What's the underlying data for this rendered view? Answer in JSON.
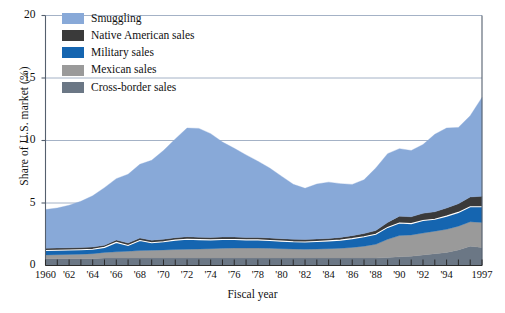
{
  "chart_data": {
    "type": "area",
    "stacked": true,
    "title": "",
    "xlabel": "Fiscal year",
    "ylabel": "Share of U.S. market (%)",
    "xlim": [
      1960,
      1997
    ],
    "ylim": [
      0,
      20
    ],
    "yticks": [
      0,
      5,
      10,
      15,
      20
    ],
    "ytick_labels": [
      "0",
      "5",
      "10",
      "15",
      "20"
    ],
    "grid": "horizontal",
    "legend_position": "top-left",
    "xticks": [
      1960,
      1962,
      1964,
      1966,
      1968,
      1970,
      1972,
      1974,
      1976,
      1978,
      1980,
      1982,
      1984,
      1986,
      1988,
      1990,
      1992,
      1994,
      1997
    ],
    "xtick_labels": [
      "1960",
      "'62",
      "'64",
      "'66",
      "'68",
      "'70",
      "'72",
      "'74",
      "'76",
      "'78",
      "'80",
      "'82",
      "'84",
      "'86",
      "'88",
      "'90",
      "'92",
      "'94",
      "1997"
    ],
    "x": [
      1960,
      1961,
      1962,
      1963,
      1964,
      1965,
      1966,
      1967,
      1968,
      1969,
      1970,
      1971,
      1972,
      1973,
      1974,
      1975,
      1976,
      1977,
      1978,
      1979,
      1980,
      1981,
      1982,
      1983,
      1984,
      1985,
      1986,
      1987,
      1988,
      1989,
      1990,
      1991,
      1992,
      1993,
      1994,
      1995,
      1996,
      1997
    ],
    "series": [
      {
        "name": "Cross-border sales",
        "color": "#6b7785",
        "order": 1,
        "values": [
          0.55,
          0.55,
          0.55,
          0.55,
          0.55,
          0.6,
          0.6,
          0.6,
          0.6,
          0.6,
          0.6,
          0.6,
          0.6,
          0.6,
          0.6,
          0.6,
          0.6,
          0.6,
          0.6,
          0.6,
          0.6,
          0.6,
          0.6,
          0.6,
          0.6,
          0.6,
          0.6,
          0.6,
          0.6,
          0.65,
          0.7,
          0.75,
          0.85,
          0.95,
          1.05,
          1.25,
          1.55,
          1.45
        ]
      },
      {
        "name": "Mexican sales",
        "color": "#9a9a9a",
        "order": 2,
        "values": [
          0.3,
          0.32,
          0.34,
          0.36,
          0.4,
          0.45,
          0.5,
          0.55,
          0.6,
          0.62,
          0.65,
          0.68,
          0.7,
          0.72,
          0.75,
          0.78,
          0.8,
          0.8,
          0.8,
          0.78,
          0.75,
          0.72,
          0.7,
          0.72,
          0.75,
          0.78,
          0.85,
          0.95,
          1.1,
          1.45,
          1.7,
          1.7,
          1.75,
          1.8,
          1.85,
          1.9,
          1.95,
          2.0
        ]
      },
      {
        "name": "Military sales",
        "color": "#1565b0",
        "order": 3,
        "values": [
          0.35,
          0.35,
          0.35,
          0.35,
          0.35,
          0.4,
          0.75,
          0.45,
          0.8,
          0.6,
          0.65,
          0.75,
          0.8,
          0.75,
          0.7,
          0.7,
          0.68,
          0.65,
          0.65,
          0.62,
          0.6,
          0.58,
          0.58,
          0.6,
          0.62,
          0.65,
          0.7,
          0.75,
          0.8,
          0.95,
          1.0,
          0.9,
          1.0,
          0.95,
          1.05,
          1.1,
          1.2,
          1.25
        ]
      },
      {
        "name": "Native American sales",
        "color": "#3a3a3a",
        "order": 4,
        "values": [
          0.18,
          0.18,
          0.18,
          0.18,
          0.18,
          0.18,
          0.2,
          0.2,
          0.2,
          0.2,
          0.2,
          0.2,
          0.2,
          0.2,
          0.2,
          0.2,
          0.2,
          0.2,
          0.2,
          0.2,
          0.2,
          0.2,
          0.2,
          0.2,
          0.2,
          0.22,
          0.24,
          0.26,
          0.3,
          0.4,
          0.55,
          0.55,
          0.58,
          0.6,
          0.65,
          0.7,
          0.78,
          0.85
        ]
      },
      {
        "name": "Smuggling",
        "color": "#88a9d8",
        "order": 5,
        "values": [
          3.1,
          3.2,
          3.4,
          3.7,
          4.1,
          4.6,
          4.9,
          5.5,
          5.9,
          6.4,
          7.1,
          7.9,
          8.7,
          8.7,
          8.3,
          7.6,
          7.1,
          6.6,
          6.1,
          5.6,
          5.0,
          4.4,
          4.1,
          4.4,
          4.5,
          4.3,
          4.1,
          4.3,
          5.0,
          5.5,
          5.4,
          5.3,
          5.5,
          6.2,
          6.4,
          6.1,
          6.5,
          7.9
        ]
      }
    ],
    "totals": [
      4.48,
      4.6,
      4.82,
      5.14,
      5.58,
      6.23,
      6.95,
      7.3,
      8.1,
      8.42,
      9.2,
      10.13,
      11.0,
      10.97,
      10.55,
      9.88,
      9.38,
      8.85,
      8.35,
      7.8,
      7.15,
      6.5,
      6.18,
      6.52,
      6.67,
      6.55,
      6.49,
      6.86,
      7.8,
      8.95,
      9.35,
      9.2,
      9.68,
      10.5,
      10.9,
      11.05,
      12.03,
      13.45
    ]
  },
  "legend": {
    "items": [
      {
        "label": "Smuggling",
        "color": "#88a9d8"
      },
      {
        "label": "Native American sales",
        "color": "#3a3a3a"
      },
      {
        "label": "Military sales",
        "color": "#1565b0"
      },
      {
        "label": "Mexican sales",
        "color": "#9a9a9a"
      },
      {
        "label": "Cross-border sales",
        "color": "#6b7785"
      }
    ]
  },
  "axes": {
    "y_title": "Share of U.S. market (%)",
    "x_title": "Fiscal year",
    "y_labels": [
      "20",
      "15",
      "10",
      "5",
      "0"
    ],
    "x_labels": [
      "1960",
      "'62",
      "'64",
      "'66",
      "'68",
      "'70",
      "'72",
      "'74",
      "'76",
      "'78",
      "'80",
      "'82",
      "'84",
      "'86",
      "'88",
      "'90",
      "'92",
      "'94",
      "1997"
    ]
  },
  "colors": {
    "grid": "#9aa9bf",
    "axis": "#55606e",
    "background": "#ffffff"
  }
}
